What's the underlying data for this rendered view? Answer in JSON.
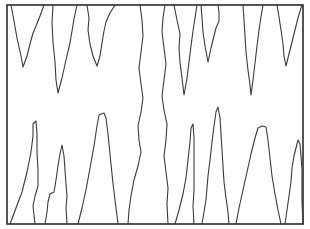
{
  "figure": {
    "canvas": {
      "width": 310,
      "height": 229
    },
    "background_color": "#ffffff",
    "stroke_color": "#3a3a3a",
    "frame_stroke_color": "#2b2b2b",
    "frame_stroke_width": 1.6,
    "line_stroke_width": 1.1,
    "frame": {
      "x": 7,
      "y": 5,
      "width": 296,
      "height": 219
    },
    "counts": {
      "top_notches": 7,
      "bottom_peaks": 7,
      "full_height_lines": 2,
      "total_strokes": 16
    },
    "paths": [
      {
        "name": "top-notch-1",
        "d": "M 11 5 L 14 21 L 17 38 L 21 56 L 23 67 L 27 56 L 30 44 L 33 33 L 36 26 L 40 16 L 44 5"
      },
      {
        "name": "top-notch-2",
        "d": "M 53 5 L 52 22 L 53 42 L 55 62 L 56 80 L 58 93 L 62 78 L 66 60 L 70 43 L 72 31 L 74 19 L 77 5"
      },
      {
        "name": "top-notch-3",
        "d": "M 87 5 L 89 18 L 88 30 L 90 44 L 93 56 L 97 66 L 100 56 L 102 43 L 104 31 L 106 22 L 110 13 L 115 5"
      },
      {
        "name": "full-height-line-left",
        "d": "M 140 5 L 142 20 L 143 36 L 141 52 L 139 68 L 141 84 L 143 98 L 141 112 L 138 126 L 139 140 L 141 152 L 138 166 L 134 180 L 131 196 L 129 210 L 128 224"
      },
      {
        "name": "full-height-line-right",
        "d": "M 165 5 L 163 18 L 162 32 L 164 48 L 166 64 L 164 80 L 162 96 L 164 110 L 167 124 L 166 140 L 164 156 L 166 172 L 168 188 L 167 204 L 168 224"
      },
      {
        "name": "top-notch-4",
        "d": "M 174 5 L 177 20 L 180 34 L 179 48 L 180 62 L 182 78 L 184 95 L 187 78 L 189 62 L 191 46 L 193 31 L 195 18 L 197 5"
      },
      {
        "name": "top-notch-5",
        "d": "M 201 5 L 202 18 L 203 32 L 205 46 L 208 62 L 211 48 L 214 36 L 216 28 L 219 21 L 219 12 L 218 5"
      },
      {
        "name": "top-notch-6",
        "d": "M 243 5 L 244 20 L 245 36 L 246 52 L 248 70 L 250 85 L 251 95 L 253 80 L 255 63 L 257 46 L 259 30 L 261 17 L 263 5"
      },
      {
        "name": "top-notch-7",
        "d": "M 277 5 L 279 17 L 281 30 L 283 44 L 284 56 L 286 66 L 289 54 L 292 42 L 295 30 L 298 18 L 301 8 L 302 5"
      },
      {
        "name": "bottom-peak-1",
        "d": "M 10 224 L 16 208 L 22 192 L 27 172 L 31 152 L 33 136 L 33 124 L 36 121 L 37 134 L 37 152 L 38 170 L 38 186 L 35 196 L 33 206 L 34 215 L 35 224"
      },
      {
        "name": "bottom-peak-2",
        "d": "M 45 224 L 47 212 L 48 202 L 50 194 L 54 192 L 56 180 L 58 166 L 60 154 L 62 145 L 64 156 L 65 170 L 66 184 L 67 196 L 66 208 L 67 224"
      },
      {
        "name": "bottom-peak-3",
        "d": "M 78 224 L 82 208 L 86 190 L 90 168 L 94 146 L 97 126 L 99 115 L 104 113 L 106 118 L 108 134 L 110 154 L 112 174 L 114 192 L 116 208 L 118 224"
      },
      {
        "name": "bottom-peak-4-spike",
        "d": "M 175 224 L 179 210 L 183 194 L 186 178 L 188 160 L 190 142 L 191 128 L 193 124 L 194 138 L 194 156 L 194 174 L 194 190 L 193 206 L 194 224"
      },
      {
        "name": "bottom-peak-5",
        "d": "M 202 224 L 204 212 L 206 200 L 207 188 L 208 176 L 210 160 L 212 142 L 214 126 L 216 112 L 218 107 L 220 118 L 221 134 L 222 150 L 223 166 L 224 182 L 226 198 L 228 212 L 229 224"
      },
      {
        "name": "bottom-peak-6",
        "d": "M 236 224 L 239 208 L 243 190 L 247 172 L 251 154 L 255 138 L 258 128 L 262 126 L 266 127 L 268 140 L 270 158 L 272 176 L 275 194 L 278 210 L 281 224"
      },
      {
        "name": "bottom-peak-7",
        "d": "M 285 224 L 287 210 L 289 196 L 291 182 L 292 168 L 294 156 L 296 148 L 298 140 L 300 144 L 301 156 L 302 170 L 302 186 L 302 202 L 303 224"
      }
    ]
  }
}
